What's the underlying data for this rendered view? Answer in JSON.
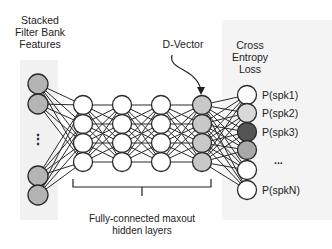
{
  "title_input": [
    "Stacked",
    "Filter Bank",
    "Features"
  ],
  "title_output": [
    "Cross",
    "Entropy",
    "Loss"
  ],
  "dvector_label": "D-Vector",
  "hidden_label": [
    "Fully-connected maxout",
    "hidden layers"
  ],
  "input_ellipsis": "⋮",
  "output_labels": [
    {
      "text": "P(spk1)",
      "row": 0
    },
    {
      "text": "P(spk2)",
      "row": 1
    },
    {
      "text": "P(spk3)",
      "row": 2
    },
    {
      "text": "...",
      "row": 3.5
    },
    {
      "text": "P(spkN)",
      "row": 5
    }
  ],
  "colors": {
    "input_fill": "#b4b4b4",
    "hidden_fill": "#ffffff",
    "dvector_fill": "#c8c8c8",
    "stroke": "#2a2a2a",
    "output_fills": [
      "#ffffff",
      "#d9d9d9",
      "#555555",
      "#a8a8a8",
      "#ffffff",
      "#ffffff"
    ]
  },
  "network": {
    "input_nodes": 4,
    "hidden_layers": 3,
    "hidden_nodes_per_layer": 4,
    "dvector_nodes": 4,
    "output_nodes": 6
  }
}
